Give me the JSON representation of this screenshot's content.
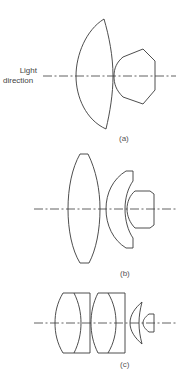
{
  "figure": {
    "light_label_line1": "Light",
    "light_label_line2": "direction",
    "panels": [
      {
        "id": "a",
        "caption": "(a)",
        "elements": 2
      },
      {
        "id": "b",
        "caption": "(b)",
        "elements": 3
      },
      {
        "id": "c",
        "caption": "(c)",
        "elements": 6
      }
    ],
    "stroke_color": "#3a3a3a"
  }
}
